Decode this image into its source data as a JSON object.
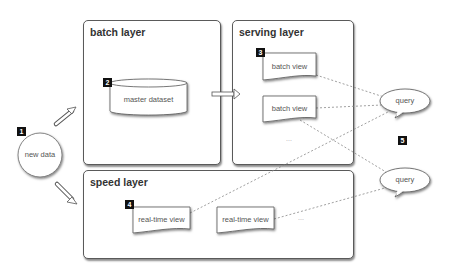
{
  "diagram": {
    "layers": {
      "batch": {
        "title": "batch layer"
      },
      "serving": {
        "title": "serving layer"
      },
      "speed": {
        "title": "speed layer"
      }
    },
    "nodes": {
      "new_data": {
        "label": "new data",
        "badge": "1"
      },
      "master_dataset": {
        "label": "master dataset",
        "badge": "2"
      },
      "batch_view_1": {
        "label": "batch view",
        "badge": "3"
      },
      "batch_view_2": {
        "label": "batch view"
      },
      "serving_ellipsis": "...",
      "real_time_view_1": {
        "label": "real-time view",
        "badge": "4"
      },
      "real_time_view_2": {
        "label": "real-time view"
      },
      "speed_ellipsis": "...",
      "query_1": {
        "label": "query"
      },
      "query_2": {
        "label": "query"
      },
      "query_badge": "5"
    },
    "colors": {
      "frame_border": "#5a5a5a",
      "badge_bg": "#111111",
      "badge_text": "#ffffff",
      "title_text": "#333333",
      "node_text": "#555555",
      "connector": "#888888"
    }
  }
}
